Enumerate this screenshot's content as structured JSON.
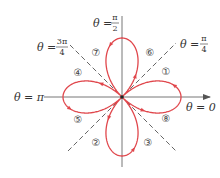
{
  "figure": {
    "origin": {
      "x": 122,
      "y": 97
    },
    "radius": 59,
    "curve_color": "#e0474c",
    "axis_color": "#777777",
    "dashed_color": "#666666"
  },
  "labels": {
    "theta_0": {
      "prefix": "θ = ",
      "value": "0"
    },
    "theta_pi": {
      "prefix": "θ = ",
      "value": "π"
    },
    "theta_pi_2": {
      "prefix": "θ = ",
      "num": "π",
      "den": "2"
    },
    "theta_pi_4": {
      "prefix": "θ = ",
      "num": "π",
      "den": "4"
    },
    "theta_3pi_4": {
      "prefix": "θ = ",
      "num": "3π",
      "den": "4"
    }
  },
  "petal_order_markers": [
    {
      "n": "1",
      "glyph": "①"
    },
    {
      "n": "2",
      "glyph": "②"
    },
    {
      "n": "3",
      "glyph": "③"
    },
    {
      "n": "4",
      "glyph": "④"
    },
    {
      "n": "5",
      "glyph": "⑤"
    },
    {
      "n": "6",
      "glyph": "⑥"
    },
    {
      "n": "7",
      "glyph": "⑦"
    },
    {
      "n": "8",
      "glyph": "⑧"
    }
  ]
}
